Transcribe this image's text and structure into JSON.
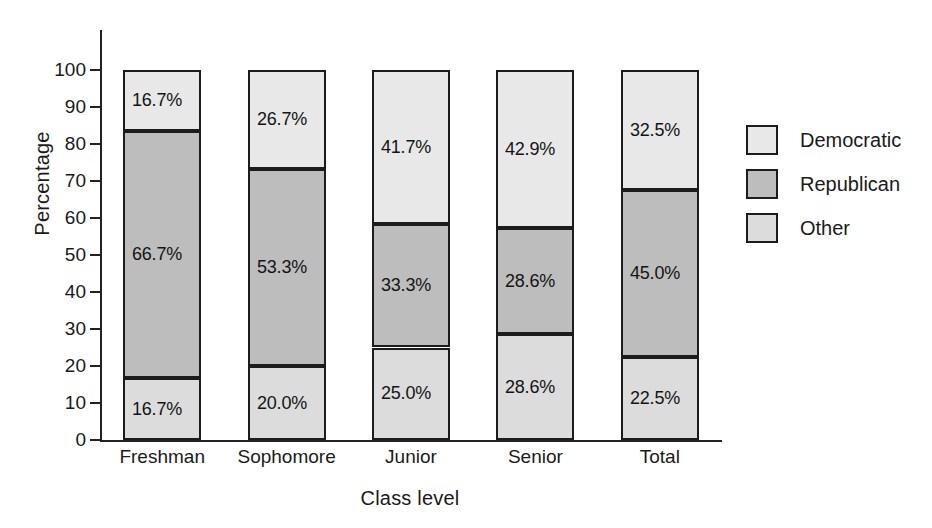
{
  "chart_data": {
    "type": "bar",
    "stacked": true,
    "title": "",
    "xlabel": "Class level",
    "ylabel": "Percentage",
    "categories": [
      "Freshman",
      "Sophomore",
      "Junior",
      "Senior",
      "Total"
    ],
    "ylim": [
      0,
      100
    ],
    "yticks": [
      0,
      10,
      20,
      30,
      40,
      50,
      60,
      70,
      80,
      90,
      100
    ],
    "ytick_labels": [
      "0",
      "10",
      "20",
      "30",
      "40",
      "50",
      "60",
      "70",
      "80",
      "90",
      "100"
    ],
    "grid": false,
    "legend_position": "right",
    "stack_order_bottom_to_top": [
      "Other",
      "Republican",
      "Democratic"
    ],
    "series": [
      {
        "name": "Other",
        "color": "#dcdcdc",
        "values": [
          16.7,
          20.0,
          25.0,
          28.6,
          22.5
        ],
        "labels": [
          "16.7%",
          "20.0%",
          "25.0%",
          "28.6%",
          "22.5%"
        ]
      },
      {
        "name": "Republican",
        "color": "#bdbdbd",
        "values": [
          66.7,
          53.3,
          33.3,
          28.6,
          45.0
        ],
        "labels": [
          "66.7%",
          "53.3%",
          "33.3%",
          "28.6%",
          "45.0%"
        ]
      },
      {
        "name": "Democratic",
        "color": "#e8e8e8",
        "values": [
          16.7,
          26.7,
          41.7,
          42.9,
          32.5
        ],
        "labels": [
          "16.7%",
          "26.7%",
          "41.7%",
          "42.9%",
          "32.5%"
        ]
      }
    ]
  },
  "legend": {
    "entries": [
      {
        "label": "Democratic",
        "color": "#e8e8e8"
      },
      {
        "label": "Republican",
        "color": "#bdbdbd"
      },
      {
        "label": "Other",
        "color": "#dcdcdc"
      }
    ]
  }
}
